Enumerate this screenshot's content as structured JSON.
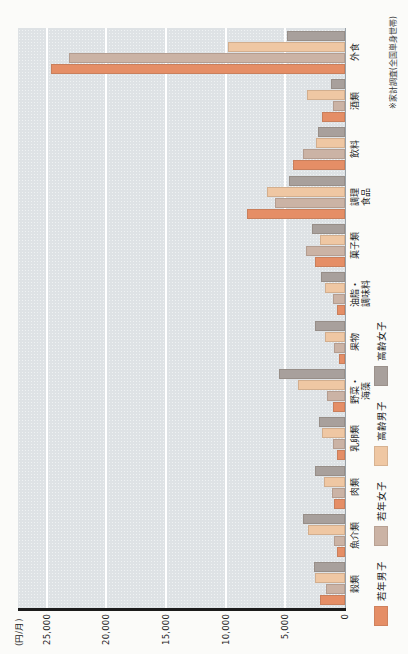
{
  "unit_label": "(円/月)",
  "note": "※家計調査(全国単身世帯)",
  "colors": {
    "plot_bg": "#e2e7ea",
    "gridline": "#ffffff",
    "axis": "#1c1c1c",
    "young_male": "#e58e66",
    "young_female": "#cbb3a5",
    "old_male": "#efc7a3",
    "old_female": "#a8a09c"
  },
  "chart_data": {
    "type": "bar",
    "rotation": "whole chart rotated 90deg counterclockwise; text reads bottom-to-top",
    "title": "",
    "ylabel": "(円/月)",
    "categories": [
      "穀類",
      "魚介類",
      "肉類",
      "乳卵類",
      "野菜・\n海藻",
      "果物",
      "油脂・\n調味料",
      "菓子類",
      "調理\n食品",
      "飲料",
      "酒類",
      "外食"
    ],
    "series": [
      {
        "name": "若年男子",
        "color": "#e58e66",
        "values": [
          2100,
          700,
          900,
          700,
          1000,
          500,
          700,
          2500,
          8200,
          4400,
          1900,
          24600
        ]
      },
      {
        "name": "若年女子",
        "color": "#cbb3a5",
        "values": [
          1600,
          900,
          1100,
          1000,
          1500,
          900,
          1000,
          3300,
          5900,
          3500,
          1000,
          23100
        ]
      },
      {
        "name": "高齢男子",
        "color": "#efc7a3",
        "values": [
          2500,
          3100,
          1800,
          1900,
          3900,
          1700,
          1700,
          2100,
          6500,
          2400,
          3200,
          9800
        ]
      },
      {
        "name": "高齢女子",
        "color": "#a8a09c",
        "values": [
          2600,
          3500,
          2500,
          2200,
          5500,
          2500,
          2000,
          2800,
          4700,
          2300,
          1200,
          4900
        ]
      }
    ],
    "yticks": [
      0,
      5000,
      10000,
      15000,
      20000,
      25000
    ],
    "ytick_labels": [
      "0",
      "5,000",
      "10,000",
      "15,000",
      "20,000",
      "25,000"
    ],
    "ymax": 27400,
    "grid": true,
    "legend_position": "bottom-left",
    "note_position": "bottom-right"
  }
}
